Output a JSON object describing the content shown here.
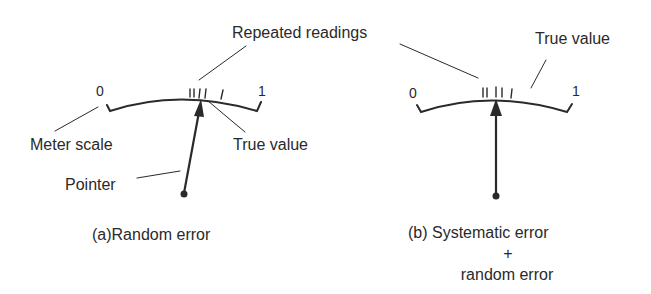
{
  "figure": {
    "shared_label": "Repeated readings",
    "panel_a": {
      "scale_min": "0",
      "scale_max": "1",
      "meter_scale_label": "Meter scale",
      "true_value_label": "True value",
      "pointer_label": "Pointer",
      "caption": "(a)Random error",
      "reading_tick_count": 5
    },
    "panel_b": {
      "scale_min": "0",
      "scale_max": "1",
      "true_value_label": "True value",
      "caption_line1": "(b) Systematic error",
      "caption_line2": "+",
      "caption_line3": "random error",
      "reading_tick_count": 5
    },
    "colors": {
      "ink": "#2a2a2a",
      "background": "#ffffff"
    }
  }
}
